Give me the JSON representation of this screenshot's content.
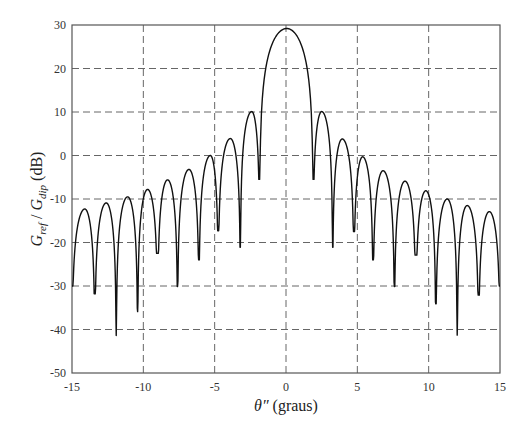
{
  "chart_data": {
    "type": "line",
    "title": "",
    "xlabel": "θ″ (graus)",
    "xlabel_parts": {
      "symbol": "θ″",
      "unit": " (graus)"
    },
    "ylabel": "G_ref / G_dip (dB)",
    "ylabel_parts": {
      "g1": "G",
      "sub1": "ref",
      "sep": " / ",
      "g2": "G",
      "sub2": "dip",
      "unit": " (dB)"
    },
    "xlim": [
      -15,
      15
    ],
    "ylim": [
      -50,
      30
    ],
    "xticks": [
      -15,
      -10,
      -5,
      0,
      5,
      10,
      15
    ],
    "yticks": [
      -50,
      -40,
      -30,
      -20,
      -10,
      0,
      10,
      20,
      30
    ],
    "x_grid": [
      -10,
      -5,
      0,
      5,
      10
    ],
    "y_grid": [
      -40,
      -30,
      -20,
      -10,
      0,
      10,
      20
    ],
    "grid": true,
    "grid_style": "dashed",
    "legend": null,
    "series": [
      {
        "name": "G_ref / G_dip",
        "color": "#111111",
        "start": {
          "x": -15.0,
          "y": -30.0
        },
        "end": {
          "x": 15.0,
          "y": -30.0
        },
        "nulls": [
          {
            "x": -13.4,
            "y": -31.8
          },
          {
            "x": -11.9,
            "y": -41.4
          },
          {
            "x": -10.4,
            "y": -35.9
          },
          {
            "x": -9.0,
            "y": -22.5
          },
          {
            "x": -7.6,
            "y": -30.1
          },
          {
            "x": -6.1,
            "y": -24.0
          },
          {
            "x": -4.75,
            "y": -17.3
          },
          {
            "x": -3.2,
            "y": -21.1
          },
          {
            "x": -1.85,
            "y": -5.5
          },
          {
            "x": 1.9,
            "y": -5.5
          },
          {
            "x": 3.27,
            "y": -21.1
          },
          {
            "x": 4.76,
            "y": -17.5
          },
          {
            "x": 6.1,
            "y": -24.0
          },
          {
            "x": 7.6,
            "y": -30.1
          },
          {
            "x": 9.1,
            "y": -22.9
          },
          {
            "x": 10.5,
            "y": -34.1
          },
          {
            "x": 12.0,
            "y": -41.3
          },
          {
            "x": 13.5,
            "y": -32.1
          }
        ],
        "peaks": [
          {
            "x": -14.1,
            "y": -12.3
          },
          {
            "x": -12.6,
            "y": -10.9
          },
          {
            "x": -11.1,
            "y": -9.5
          },
          {
            "x": -9.7,
            "y": -7.8
          },
          {
            "x": -8.3,
            "y": -5.6
          },
          {
            "x": -6.8,
            "y": -3.2
          },
          {
            "x": -5.3,
            "y": 0.0
          },
          {
            "x": -3.9,
            "y": 3.9
          },
          {
            "x": -2.4,
            "y": 10.1
          },
          {
            "x": 0.05,
            "y": 29.2
          },
          {
            "x": 2.5,
            "y": 10.1
          },
          {
            "x": 3.94,
            "y": 3.8
          },
          {
            "x": 5.37,
            "y": -0.3
          },
          {
            "x": 6.8,
            "y": -3.5
          },
          {
            "x": 8.34,
            "y": -5.9
          },
          {
            "x": 9.8,
            "y": -8.1
          },
          {
            "x": 11.3,
            "y": -10.0
          },
          {
            "x": 12.7,
            "y": -11.5
          },
          {
            "x": 14.25,
            "y": -12.9
          }
        ]
      }
    ]
  }
}
